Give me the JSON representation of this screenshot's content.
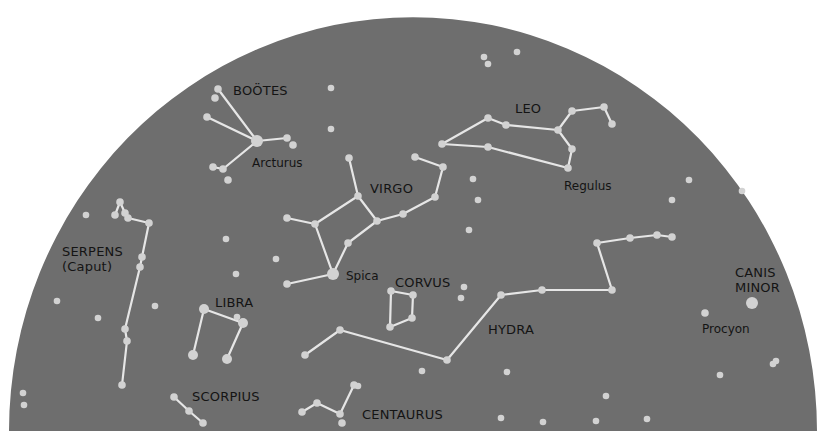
{
  "chart": {
    "title": "",
    "colors": {
      "sky": "#6e6e6e",
      "star": "#d2d2d2",
      "line": "#e6e6e6",
      "text": "#141414",
      "background": "#ffffff"
    },
    "dome": {
      "cx": 413,
      "baseline_y": 431,
      "rx": 404,
      "ry": 414
    }
  },
  "chart_data": {
    "type": "diagram",
    "constellations": [
      {
        "name": "BOÖTES",
        "label_pos": [
          233,
          95
        ],
        "stars": [
          [
            218,
            89
          ],
          [
            215,
            98
          ],
          [
            207,
            117
          ],
          [
            257,
            141
          ],
          [
            287,
            138
          ],
          [
            293,
            145
          ],
          [
            213,
            167
          ],
          [
            223,
            169
          ],
          [
            228,
            180
          ]
        ],
        "lines": [
          [
            0,
            3
          ],
          [
            2,
            3
          ],
          [
            3,
            4
          ],
          [
            3,
            7
          ],
          [
            7,
            6
          ]
        ]
      },
      {
        "name": "VIRGO",
        "label_pos": [
          370,
          193
        ],
        "stars": [
          [
            349,
            158
          ],
          [
            358,
            196
          ],
          [
            377,
            221
          ],
          [
            403,
            214
          ],
          [
            435,
            197
          ],
          [
            443,
            167
          ],
          [
            415,
            157
          ],
          [
            315,
            224
          ],
          [
            287,
            218
          ],
          [
            333,
            274
          ],
          [
            348,
            243
          ],
          [
            287,
            284
          ]
        ],
        "lines": [
          [
            0,
            1
          ],
          [
            1,
            2
          ],
          [
            2,
            3
          ],
          [
            3,
            4
          ],
          [
            4,
            5
          ],
          [
            5,
            6
          ],
          [
            1,
            7
          ],
          [
            7,
            8
          ],
          [
            7,
            9
          ],
          [
            9,
            10
          ],
          [
            10,
            2
          ],
          [
            9,
            11
          ]
        ]
      },
      {
        "name": "LEO",
        "label_pos": [
          515,
          113
        ],
        "stars": [
          [
            442,
            144
          ],
          [
            488,
            147
          ],
          [
            488,
            118
          ],
          [
            506,
            125
          ],
          [
            558,
            130
          ],
          [
            572,
            111
          ],
          [
            604,
            107
          ],
          [
            612,
            124
          ],
          [
            572,
            149
          ],
          [
            568,
            168
          ]
        ],
        "lines": [
          [
            0,
            1
          ],
          [
            0,
            2
          ],
          [
            2,
            3
          ],
          [
            3,
            4
          ],
          [
            4,
            5
          ],
          [
            5,
            6
          ],
          [
            6,
            7
          ],
          [
            4,
            8
          ],
          [
            8,
            9
          ],
          [
            1,
            9
          ]
        ]
      },
      {
        "name": "SERPENS (Caput)",
        "label_pos": [
          62,
          256
        ],
        "stars": [
          [
            120,
            202
          ],
          [
            115,
            215
          ],
          [
            125,
            213
          ],
          [
            128,
            218
          ],
          [
            149,
            223
          ],
          [
            142,
            257
          ],
          [
            140,
            267
          ],
          [
            125,
            329
          ],
          [
            127,
            341
          ],
          [
            122,
            385
          ]
        ],
        "lines": [
          [
            1,
            0
          ],
          [
            0,
            2
          ],
          [
            2,
            3
          ],
          [
            3,
            4
          ],
          [
            4,
            5
          ],
          [
            5,
            6
          ],
          [
            6,
            7
          ],
          [
            7,
            8
          ],
          [
            8,
            9
          ]
        ]
      },
      {
        "name": "LIBRA",
        "label_pos": [
          215,
          307
        ],
        "stars": [
          [
            204,
            309
          ],
          [
            243,
            323
          ],
          [
            193,
            355
          ],
          [
            227,
            359
          ]
        ],
        "lines": [
          [
            0,
            1
          ],
          [
            0,
            2
          ],
          [
            1,
            3
          ]
        ]
      },
      {
        "name": "SCORPIUS",
        "label_pos": [
          192,
          401
        ],
        "stars": [
          [
            174,
            397
          ],
          [
            189,
            411
          ],
          [
            203,
            423
          ]
        ],
        "lines": [
          [
            0,
            1
          ],
          [
            1,
            2
          ]
        ]
      },
      {
        "name": "CORVUS",
        "label_pos": [
          395,
          287
        ],
        "stars": [
          [
            391,
            291
          ],
          [
            413,
            295
          ],
          [
            412,
            318
          ],
          [
            390,
            327
          ]
        ],
        "lines": [
          [
            0,
            1
          ],
          [
            1,
            2
          ],
          [
            2,
            3
          ],
          [
            3,
            0
          ]
        ]
      },
      {
        "name": "HYDRA",
        "label_pos": [
          488,
          334
        ],
        "stars": [
          [
            305,
            355
          ],
          [
            340,
            330
          ],
          [
            447,
            360
          ],
          [
            501,
            295
          ],
          [
            542,
            290
          ],
          [
            612,
            290
          ],
          [
            597,
            243
          ],
          [
            630,
            238
          ],
          [
            657,
            235
          ],
          [
            672,
            237
          ]
        ],
        "lines": [
          [
            0,
            1
          ],
          [
            1,
            2
          ],
          [
            2,
            3
          ],
          [
            3,
            4
          ],
          [
            4,
            5
          ],
          [
            5,
            6
          ],
          [
            6,
            7
          ],
          [
            7,
            8
          ],
          [
            8,
            9
          ]
        ]
      },
      {
        "name": "CENTAURUS",
        "label_pos": [
          362,
          419
        ],
        "stars": [
          [
            302,
            412
          ],
          [
            317,
            403
          ],
          [
            340,
            414
          ],
          [
            354,
            385
          ],
          [
            342,
            423
          ]
        ],
        "lines": [
          [
            0,
            1
          ],
          [
            1,
            2
          ],
          [
            2,
            3
          ]
        ]
      },
      {
        "name": "CANIS MINOR",
        "label_pos": [
          735,
          277
        ],
        "stars": [
          [
            752,
            303
          ],
          [
            705,
            313
          ]
        ],
        "lines": []
      }
    ],
    "named_stars": [
      {
        "name": "Arcturus",
        "pos": [
          257,
          141
        ],
        "label_pos": [
          252,
          167
        ]
      },
      {
        "name": "Spica",
        "pos": [
          333,
          274
        ],
        "label_pos": [
          346,
          280
        ]
      },
      {
        "name": "Regulus",
        "pos": [
          568,
          168
        ],
        "label_pos": [
          564,
          190
        ]
      },
      {
        "name": "Procyon",
        "pos": [
          752,
          303
        ],
        "label_pos": [
          702,
          333
        ]
      }
    ],
    "field_stars": [
      [
        331,
        88
      ],
      [
        331,
        129
      ],
      [
        484,
        57
      ],
      [
        488,
        64
      ],
      [
        517,
        52
      ],
      [
        473,
        179
      ],
      [
        478,
        200
      ],
      [
        689,
        180
      ],
      [
        672,
        200
      ],
      [
        742,
        191
      ],
      [
        86,
        215
      ],
      [
        57,
        301
      ],
      [
        98,
        318
      ],
      [
        155,
        306
      ],
      [
        226,
        239
      ],
      [
        236,
        274
      ],
      [
        276,
        259
      ],
      [
        237,
        317
      ],
      [
        23,
        393
      ],
      [
        24,
        405
      ],
      [
        464,
        287
      ],
      [
        461,
        298
      ],
      [
        469,
        230
      ],
      [
        507,
        372
      ],
      [
        606,
        396
      ],
      [
        501,
        418
      ],
      [
        543,
        422
      ],
      [
        596,
        421
      ],
      [
        647,
        419
      ],
      [
        720,
        375
      ],
      [
        773,
        364
      ],
      [
        776,
        361
      ],
      [
        422,
        371
      ],
      [
        358,
        386
      ]
    ],
    "bright_stars": [
      [
        257,
        141
      ],
      [
        333,
        274
      ],
      [
        752,
        303
      ],
      [
        204,
        309
      ],
      [
        243,
        323
      ],
      [
        193,
        355
      ],
      [
        227,
        359
      ]
    ]
  }
}
